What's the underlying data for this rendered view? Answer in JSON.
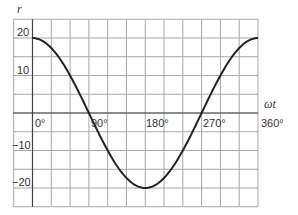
{
  "chart_data": {
    "type": "line",
    "title": "",
    "xlabel": "ωt",
    "ylabel": "r",
    "x_tick_labels": [
      "0°",
      "90°",
      "180°",
      "270°",
      "360°"
    ],
    "y_tick_labels": [
      "20",
      "10",
      "-10",
      "-20"
    ],
    "xlim": [
      -30,
      360
    ],
    "ylim": [
      -25,
      25
    ],
    "grid": true,
    "grid_step_x_deg": 30,
    "grid_step_y": 5,
    "series": [
      {
        "name": "r = 20 cos(ωt)",
        "x": [
          0,
          30,
          60,
          90,
          120,
          150,
          180,
          210,
          240,
          270,
          300,
          330,
          360
        ],
        "values": [
          20,
          17.3,
          10,
          0,
          -10,
          -17.3,
          -20,
          -17.3,
          -10,
          0,
          10,
          17.3,
          20
        ],
        "color": "#222222"
      }
    ]
  },
  "labels": {
    "y_axis": "r",
    "x_axis": "ωt",
    "x0": "0°",
    "x90": "90°",
    "x180": "180°",
    "x270": "270°",
    "x360": "360°",
    "y20": "20",
    "y10": "10",
    "ym10": "−10",
    "ym20": "−20"
  },
  "colors": {
    "grid": "#a8a8a8",
    "axis": "#444444",
    "curve": "#222222",
    "background": "#ffffff"
  }
}
